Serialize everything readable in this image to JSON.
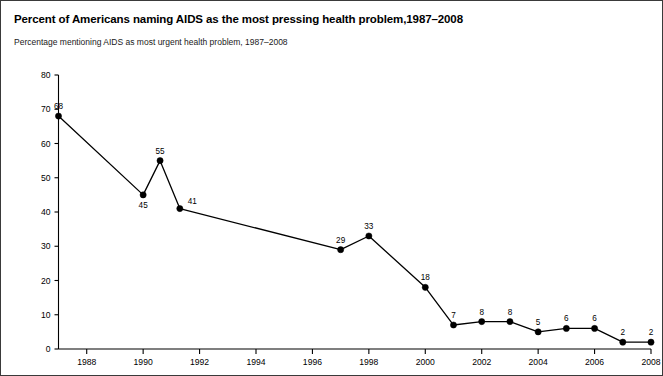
{
  "header": {
    "title": "Percent of Americans naming AIDS as the most pressing health problem,1987–2008",
    "subtitle": "Percentage mentioning AIDS as most urgent health problem, 1987–2008"
  },
  "colors": {
    "line": "#000000",
    "marker": "#000000",
    "axis": "#000000",
    "text": "#000000",
    "background": "#ffffff",
    "border": "#3a3a3a"
  },
  "chart_data": {
    "type": "line",
    "title": "Percent of Americans naming AIDS as the most pressing health problem,1987–2008",
    "subtitle": "Percentage mentioning AIDS as most urgent health problem, 1987–2008",
    "xlabel": "",
    "ylabel": "",
    "xlim": [
      1987,
      2008
    ],
    "ylim": [
      0,
      80
    ],
    "ytick_values": [
      0,
      10,
      20,
      30,
      40,
      50,
      60,
      70,
      80
    ],
    "ytick_labels": [
      "0",
      "10",
      "20",
      "30",
      "40",
      "50",
      "60",
      "70",
      "80"
    ],
    "xtick_values": [
      1988,
      1990,
      1992,
      1994,
      1996,
      1998,
      2000,
      2002,
      2004,
      2006,
      2008
    ],
    "xtick_labels": [
      "1988",
      "1990",
      "1992",
      "1994",
      "1996",
      "1998",
      "2000",
      "2002",
      "2004",
      "2006",
      "2008"
    ],
    "grid": false,
    "legend": false,
    "markers": true,
    "data_labels": true,
    "x": [
      1987,
      1990,
      1990.6,
      1991.3,
      1997,
      1998,
      2000,
      2001,
      2002,
      2003,
      2004,
      2005,
      2006,
      2007,
      2008
    ],
    "values": [
      68,
      45,
      55,
      41,
      29,
      33,
      18,
      7,
      8,
      8,
      5,
      6,
      6,
      2,
      2
    ],
    "point_labels": [
      "68",
      "45",
      "55",
      "41",
      "29",
      "33",
      "18",
      "7",
      "8",
      "8",
      "5",
      "6",
      "6",
      "2",
      "2"
    ],
    "label_positions": [
      "above",
      "below",
      "above",
      "above-right",
      "above",
      "above",
      "above",
      "above",
      "above",
      "above",
      "above",
      "above",
      "above",
      "above",
      "above"
    ],
    "series": [
      {
        "name": "AIDS named most urgent health problem",
        "values": [
          68,
          45,
          55,
          41,
          29,
          33,
          18,
          7,
          8,
          8,
          5,
          6,
          6,
          2,
          2
        ]
      }
    ]
  }
}
